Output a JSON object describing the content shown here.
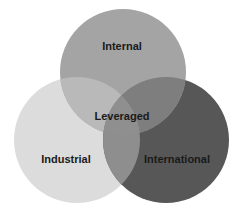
{
  "diagram": {
    "type": "venn",
    "sets": [
      {
        "id": "internal",
        "label": "Internal",
        "color": "#a4a4a4",
        "cx": 123,
        "cy": 72,
        "r": 63
      },
      {
        "id": "industrial",
        "label": "Industrial",
        "color": "#dcdcdc",
        "cx": 77,
        "cy": 140,
        "r": 63
      },
      {
        "id": "international",
        "label": "International",
        "color": "#575757",
        "cx": 166,
        "cy": 140,
        "r": 63
      }
    ],
    "center_label": "Leveraged",
    "overlap_colors": {
      "internal_industrial": "#b9b9b9",
      "internal_international": "#7e7e7e",
      "industrial_international": "#8e8e8e",
      "all": "#8f8f8f"
    }
  }
}
